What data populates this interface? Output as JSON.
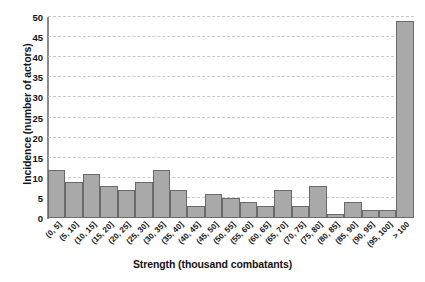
{
  "chart_data": {
    "type": "bar",
    "title": "",
    "xlabel": "Strength (thousand combatants)",
    "ylabel": "Incidence (number of actors)",
    "categories": [
      "(0, 5]",
      "(5, 10]",
      "(10, 15]",
      "(15, 20]",
      "(20, 25]",
      "(25, 30]",
      "(30, 35]",
      "(35, 40]",
      "(40, 45]",
      "(45, 50]",
      "(50, 55]",
      "(55, 60]",
      "(60, 65]",
      "(65, 70]",
      "(70, 75]",
      "(75, 80]",
      "(80, 85]",
      "(85, 90]",
      "(90, 95]",
      "(95, 100]",
      "> 100"
    ],
    "values": [
      12,
      9,
      11,
      8,
      7,
      9,
      12,
      7,
      3,
      6,
      5,
      4,
      3,
      7,
      3,
      8,
      1,
      4,
      2,
      2,
      49
    ],
    "ylim": [
      0,
      50
    ],
    "yticks": [
      0,
      5,
      10,
      15,
      20,
      25,
      30,
      35,
      40,
      45,
      50
    ],
    "ytick_labels": [
      "0",
      "5",
      "10",
      "15",
      "20",
      "25",
      "30",
      "35",
      "40",
      "45",
      "50"
    ],
    "grid": "horizontal-dashed",
    "legend": "none",
    "bar_color": "#a9a9a9",
    "bar_edge_color": "#6a6a6a",
    "gridline_color": "#c9c9c9",
    "axis_color": "#8c8c8c",
    "background_color": "#ffffff"
  }
}
